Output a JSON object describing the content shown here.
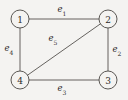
{
  "figure": {
    "type": "undirected-graph-diagram",
    "background_color": "#f4f3f1",
    "line_color": "#55514e",
    "text_color": "#2e2b29",
    "width": 128,
    "height": 100
  },
  "nodes": [
    {
      "id": "1",
      "label": "1",
      "cx": 20,
      "cy": 19,
      "r": 9,
      "position": "top-left"
    },
    {
      "id": "2",
      "label": "2",
      "cx": 108,
      "cy": 19,
      "r": 9,
      "position": "top-right"
    },
    {
      "id": "3",
      "label": "3",
      "cx": 108,
      "cy": 80,
      "r": 9,
      "position": "bottom-right"
    },
    {
      "id": "4",
      "label": "4",
      "cx": 20,
      "cy": 80,
      "r": 9,
      "position": "bottom-left"
    }
  ],
  "edges": [
    {
      "id": "e1",
      "base": "e",
      "subscript": "1",
      "from": "1",
      "to": "2",
      "x1": 29,
      "y1": 19,
      "x2": 99,
      "y2": 19,
      "label_x": 62,
      "label_y": 10
    },
    {
      "id": "e2",
      "base": "e",
      "subscript": "2",
      "from": "2",
      "to": "3",
      "x1": 108,
      "y1": 28,
      "x2": 108,
      "y2": 71,
      "label_x": 117,
      "label_y": 50
    },
    {
      "id": "e3",
      "base": "e",
      "subscript": "3",
      "from": "3",
      "to": "4",
      "x1": 99,
      "y1": 80,
      "x2": 29,
      "y2": 80,
      "label_x": 62,
      "label_y": 89
    },
    {
      "id": "e4",
      "base": "e",
      "subscript": "4",
      "from": "1",
      "to": "4",
      "x1": 20,
      "y1": 28,
      "x2": 20,
      "y2": 71,
      "label_x": 9,
      "label_y": 49
    },
    {
      "id": "e5",
      "base": "e",
      "subscript": "5",
      "from": "4",
      "to": "2",
      "x1": 27.5,
      "y1": 75.2,
      "x2": 100.5,
      "y2": 23.8,
      "label_x": 53,
      "label_y": 39
    }
  ]
}
